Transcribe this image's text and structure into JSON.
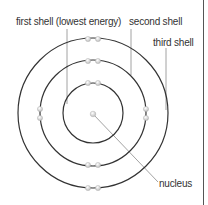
{
  "diagram": {
    "labels": {
      "first_shell": "first shell (lowest energy)",
      "second_shell": "second shell",
      "third_shell": "third shell",
      "nucleus": "nucleus"
    },
    "center": [
      93,
      113
    ],
    "shells": [
      {
        "name": "first shell",
        "radius": 30,
        "electrons": 2
      },
      {
        "name": "second shell",
        "radius": 53,
        "electrons": 8
      },
      {
        "name": "third shell",
        "radius": 75,
        "electrons": 4
      }
    ],
    "colors": {
      "shell": "#333333",
      "electron": "#d6d6d6",
      "leader": "#888888",
      "text": "#333333"
    }
  }
}
